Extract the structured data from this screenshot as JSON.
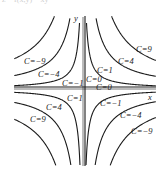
{
  "caption_fragment": "z = f(x,y) = xy",
  "diagram": {
    "axes": {
      "x_label": "x",
      "y_label": "y",
      "origin_px": [
        83,
        89
      ]
    },
    "curves": [
      {
        "C": 9,
        "label": "C=9",
        "quadrants": [
          1,
          3
        ]
      },
      {
        "C": 4,
        "label": "C=4",
        "quadrants": [
          1,
          3
        ]
      },
      {
        "C": 1,
        "label": "C=1",
        "quadrants": [
          1,
          3
        ]
      },
      {
        "C": 0,
        "label": "C=0",
        "quadrants": [
          "axes"
        ]
      },
      {
        "C": -1,
        "label": "C=−1",
        "quadrants": [
          2,
          4
        ]
      },
      {
        "C": -4,
        "label": "C=−4",
        "quadrants": [
          2,
          4
        ]
      },
      {
        "C": -9,
        "label": "C=−9",
        "quadrants": [
          2,
          4
        ]
      }
    ],
    "labels": [
      {
        "text": "C=9",
        "x": 136,
        "y": 52
      },
      {
        "text": "C=4",
        "x": 118,
        "y": 64
      },
      {
        "text": "C=1",
        "x": 97,
        "y": 73
      },
      {
        "text": "C=0",
        "x": 86,
        "y": 82
      },
      {
        "text": "C=0",
        "x": 96,
        "y": 90
      },
      {
        "text": "C=−9",
        "x": 24,
        "y": 64
      },
      {
        "text": "C=−4",
        "x": 38,
        "y": 77
      },
      {
        "text": "C=−1",
        "x": 62,
        "y": 86
      },
      {
        "text": "C=1",
        "x": 67,
        "y": 101
      },
      {
        "text": "C=4",
        "x": 46,
        "y": 110
      },
      {
        "text": "C=9",
        "x": 30,
        "y": 122
      },
      {
        "text": "C=−1",
        "x": 100,
        "y": 106
      },
      {
        "text": "C=−4",
        "x": 120,
        "y": 118
      },
      {
        "text": "C=−9",
        "x": 131,
        "y": 134
      },
      {
        "text": "x",
        "x": 148,
        "y": 100
      },
      {
        "text": "y",
        "x": 74,
        "y": 21
      }
    ]
  }
}
